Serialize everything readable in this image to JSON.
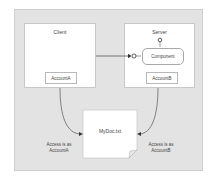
{
  "diagram": {
    "client": {
      "title": "Client",
      "account": "AccountA"
    },
    "server": {
      "title": "Server",
      "component": "Component",
      "account": "AccountB"
    },
    "document": {
      "label": "MyDoc.txt"
    },
    "notes": {
      "left_line1": "Access is as",
      "left_line2": "AccountA",
      "right_line1": "Access is as",
      "right_line2": "AccountB"
    },
    "colors": {
      "frame_bg": "#e3e3e3",
      "node_bg": "#ffffff",
      "line": "#555555"
    }
  }
}
